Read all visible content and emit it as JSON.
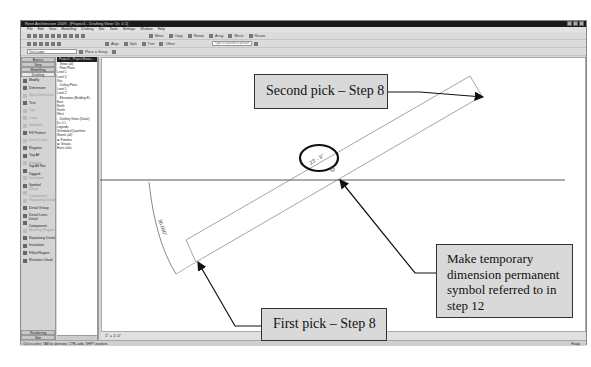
{
  "window": {
    "title": "Revit Architecture 2009 - [Project1 - Drafting View: Dr. 0 1]"
  },
  "menu": {
    "items": [
      "File",
      "Edit",
      "View",
      "Modelling",
      "Drafting",
      "Site",
      "Tools",
      "Settings",
      "Window",
      "Help"
    ]
  },
  "toolbar": {
    "row1_labels": [
      "Move",
      "Copy",
      "Rotate",
      "Array",
      "Mirror",
      "Resize"
    ],
    "row2_labels": [
      "Align",
      "Split",
      "Trim",
      "Offset"
    ],
    "search_placeholder": "Type a keyword or phrase",
    "type_selector": "Text Leader",
    "type_button": "Place a Group"
  },
  "design_bar": {
    "tabs": [
      "Basics",
      "View",
      "Modelling",
      "Drafting"
    ],
    "active_tab": "Drafting",
    "tools": [
      {
        "label": "Modify",
        "dim": false
      },
      {
        "label": "Dimension",
        "dim": false
      },
      {
        "label": "Spot Dimension",
        "dim": true
      },
      {
        "label": "Text",
        "dim": false
      },
      {
        "label": "Tag",
        "dim": true
      },
      {
        "label": "Lines",
        "dim": true
      },
      {
        "label": "Symbols",
        "dim": true
      },
      {
        "label": "Fill Pattern",
        "dim": false
      },
      {
        "label": "Detail Lines",
        "dim": true
      },
      {
        "label": "Regions",
        "dim": false
      },
      {
        "label": "Tag All",
        "dim": false
      },
      {
        "label": "Keynote",
        "dim": true
      },
      {
        "label": "Tag All Not Tagged",
        "dim": false
      },
      {
        "label": "Insulation",
        "dim": true
      },
      {
        "label": "Symbol",
        "dim": false
      },
      {
        "label": "Detail Component",
        "dim": true
      },
      {
        "label": "Repeating Detail",
        "dim": true
      },
      {
        "label": "Detail Group",
        "dim": false
      },
      {
        "label": "Detail Lines",
        "dim": false
      },
      {
        "label": "Detail Component",
        "dim": false
      },
      {
        "label": "Masking Region",
        "dim": true
      },
      {
        "label": "Repeating Detail",
        "dim": false
      },
      {
        "label": "Insulation",
        "dim": false
      },
      {
        "label": "Filled Region",
        "dim": false
      },
      {
        "label": "Revision Cloud",
        "dim": false
      }
    ],
    "bottom_tabs": [
      "Rendering",
      "Site"
    ]
  },
  "project_browser": {
    "header": "Project1 - Project Brows...",
    "items": [
      "□ Views (all)",
      "  □ Floor Plans",
      "      Level 1",
      "      Level 2",
      "      Site",
      "  □ Ceiling Plans",
      "      Level 1",
      "      Level 2",
      "  □ Elevations (Building El...",
      "      East",
      "      North",
      "      South",
      "      West",
      "  □ Drafting Views (Detail)",
      "      Dr. 0 1",
      "  Legends",
      "  Schedules/Quantities",
      "  Sheets (all)",
      "⊞ Families",
      "⊞ Groups",
      "  Revit Links"
    ]
  },
  "canvas": {
    "angle_dimension": "30.000°",
    "temp_dimension": "23' - 9\"",
    "callouts": {
      "second_pick": "Second pick – Step 8",
      "first_pick": "First pick – Step 8",
      "make_permanent": "Make temporary dimension permanent symbol referred to in step 12"
    }
  },
  "view_control_bar": {
    "scale": "1\" = 1'-0\""
  },
  "status_bar": {
    "text": "Click to select, TAB for alternates, CTRL adds, SHIFT unselects.",
    "right_text": "Ready"
  }
}
